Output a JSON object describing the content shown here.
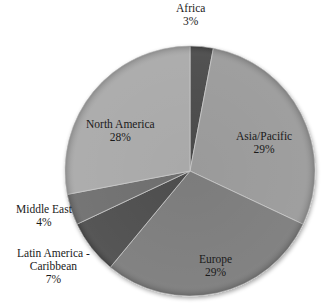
{
  "chart_data": {
    "type": "pie",
    "title": "",
    "start_angle": "12 o'clock",
    "direction": "clockwise",
    "categories": [
      "Africa",
      "Asia/Pacific",
      "Europe",
      "Latin America - Caribbean",
      "Middle East",
      "North America"
    ],
    "values": [
      3,
      29,
      29,
      7,
      4,
      28
    ],
    "unit": "%",
    "labels": [
      {
        "name": "Africa",
        "pct": "3%"
      },
      {
        "name": "Asia/Pacific",
        "pct": "29%"
      },
      {
        "name": "Europe",
        "pct": "29%"
      },
      {
        "name_line1": "Latin America -",
        "name_line2": "Caribbean",
        "pct": "7%"
      },
      {
        "name": "Middle East",
        "pct": "4%"
      },
      {
        "name": "North America",
        "pct": "28%"
      }
    ],
    "colors": [
      "#4a4a4a",
      "#9a9a9a",
      "#7c7c7c",
      "#4e4e4e",
      "#6e6e6e",
      "#a9a9a9"
    ],
    "legend": "none (data labels on/near slices)"
  }
}
